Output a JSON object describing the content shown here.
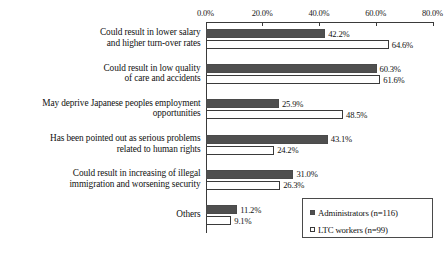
{
  "chart_data": {
    "type": "bar",
    "orientation": "horizontal",
    "title": "",
    "xlabel": "",
    "ylabel": "",
    "xlim": [
      0,
      80
    ],
    "grid": false,
    "axis_position": "top",
    "tick_labels": [
      "0.0%",
      "20.0%",
      "40.0%",
      "60.0%",
      "80.0%"
    ],
    "tick_values": [
      0,
      20,
      40,
      60,
      80
    ],
    "categories": [
      "Could result in lower salary and higher turn-over rates",
      "Could result in low quality of care and accidents",
      "May deprive Japanese peoples employment opportunities",
      "Has been pointed out as serious problems related to human rights",
      "Could result in increasing of illegal immigration and worsening security",
      "Others"
    ],
    "category_lines": [
      [
        "Could result in lower salary",
        "and higher turn-over rates"
      ],
      [
        "Could result in low quality",
        "of care and accidents"
      ],
      [
        "May deprive Japanese peoples employment",
        "opportunities"
      ],
      [
        "Has been pointed out as serious problems",
        "related to human rights"
      ],
      [
        "Could result in increasing of illegal",
        "immigration and worsening security"
      ],
      [
        "Others"
      ]
    ],
    "series": [
      {
        "name": "Administrators (n=116)",
        "key": "admin",
        "color": "#4f4f4f",
        "values": [
          42.2,
          60.3,
          25.9,
          43.1,
          31.0,
          11.2
        ],
        "labels": [
          "42.2%",
          "60.3%",
          "25.9%",
          "43.1%",
          "31.0%",
          "11.2%"
        ]
      },
      {
        "name": "LTC workers (n=99)",
        "key": "ltc",
        "color": "#ffffff",
        "values": [
          64.6,
          61.6,
          48.5,
          24.2,
          26.3,
          9.1
        ],
        "labels": [
          "64.6%",
          "61.6%",
          "48.5%",
          "24.2%",
          "26.3%",
          "9.1%"
        ]
      }
    ],
    "legend": {
      "position": "bottom-right",
      "entries": [
        {
          "label": "Administrators (n=116)",
          "swatch": "filled-dark"
        },
        {
          "label": "LTC workers (n=99)",
          "swatch": "outlined-white"
        }
      ]
    }
  }
}
